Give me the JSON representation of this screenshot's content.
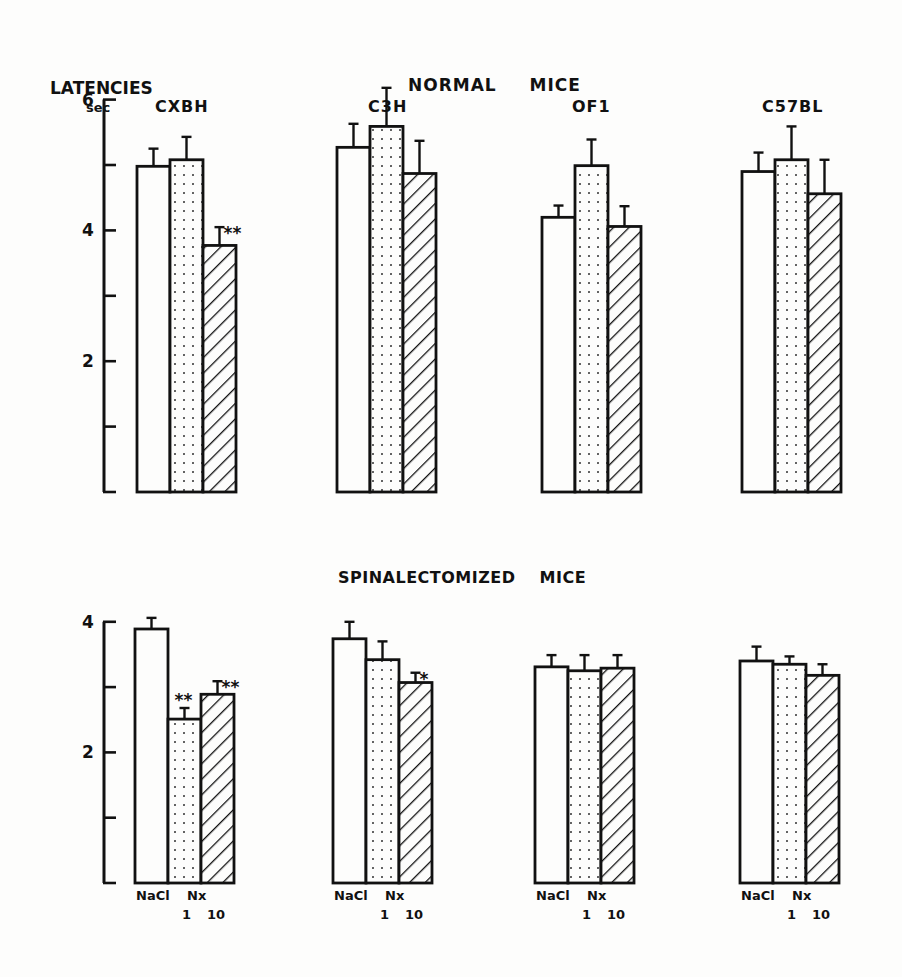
{
  "chart_data": [
    {
      "type": "bar",
      "panel": "top",
      "title": "NORMAL MICE",
      "ylabel": "LATENCIES",
      "yunit": "sec",
      "ylim": [
        0,
        6
      ],
      "yticks": [
        0,
        1,
        2,
        3,
        4,
        5,
        6
      ],
      "ytick_labels": {
        "2": "2",
        "4": "4",
        "6": "6"
      },
      "grid": false,
      "legend": "none (treatment shown by fill: open=NaCl, dotted=Nx 1, hatched=Nx 10)",
      "treatments": [
        "NaCl",
        "Nx 1",
        "Nx 10"
      ],
      "categories": [
        "CXBH",
        "C3H",
        "OF1",
        "C57BL"
      ],
      "series": [
        {
          "name": "NaCl",
          "fill": "open",
          "values": [
            4.98,
            5.27,
            4.2,
            4.9
          ],
          "error": [
            0.27,
            0.36,
            0.18,
            0.29
          ]
        },
        {
          "name": "Nx 1",
          "fill": "dotted",
          "values": [
            5.08,
            5.59,
            4.99,
            5.08
          ],
          "error": [
            0.35,
            0.59,
            0.4,
            0.51
          ]
        },
        {
          "name": "Nx 10",
          "fill": "hatched",
          "values": [
            3.77,
            4.87,
            4.06,
            4.56
          ],
          "error": [
            0.28,
            0.5,
            0.31,
            0.52
          ]
        }
      ],
      "annotations": [
        {
          "category": "CXBH",
          "series": "Nx 10",
          "text": "**"
        }
      ]
    },
    {
      "type": "bar",
      "panel": "bottom",
      "title": "SPINALECTOMIZED MICE",
      "ylim": [
        0,
        4
      ],
      "yticks": [
        0,
        1,
        2,
        3,
        4
      ],
      "ytick_labels": {
        "2": "2",
        "4": "4"
      },
      "grid": false,
      "treatments": [
        "NaCl",
        "Nx 1",
        "Nx 10"
      ],
      "categories": [
        "CXBH",
        "C3H",
        "OF1",
        "C57BL"
      ],
      "series": [
        {
          "name": "NaCl",
          "fill": "open",
          "values": [
            3.89,
            3.74,
            3.31,
            3.4
          ],
          "error": [
            0.17,
            0.26,
            0.18,
            0.22
          ]
        },
        {
          "name": "Nx 1",
          "fill": "dotted",
          "values": [
            2.51,
            3.42,
            3.25,
            3.35
          ],
          "error": [
            0.17,
            0.28,
            0.24,
            0.12
          ]
        },
        {
          "name": "Nx 10",
          "fill": "hatched",
          "values": [
            2.89,
            3.07,
            3.29,
            3.18
          ],
          "error": [
            0.2,
            0.15,
            0.2,
            0.17
          ]
        }
      ],
      "annotations": [
        {
          "category": "CXBH",
          "series": "Nx 1",
          "text": "**"
        },
        {
          "category": "CXBH",
          "series": "Nx 10",
          "text": "**"
        },
        {
          "category": "C3H",
          "series": "Nx 10",
          "text": "*"
        }
      ],
      "xlabels": {
        "NaCl": "NaCl",
        "Nx": "Nx",
        "dose1": "1",
        "dose10": "10"
      }
    }
  ],
  "labels": {
    "y_title": "LATENCIES",
    "y_unit": "sec",
    "top_title": "NORMAL MICE",
    "bottom_title": "SPINALECTOMIZED MICE",
    "strains": [
      "CXBH",
      "C3H",
      "OF1",
      "C57BL"
    ],
    "x_nacl": "NaCl",
    "x_nx": "Nx",
    "x_dose1": "1",
    "x_dose10": "10"
  },
  "colors": {
    "ink": "#111111",
    "paper": "#fdfdfc"
  }
}
